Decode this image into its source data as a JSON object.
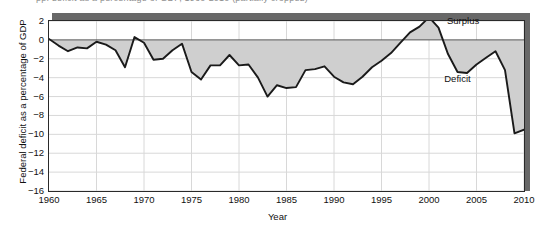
{
  "figure": {
    "cropped_title": "pp. deficit as a percentage of GDP, 1960-2010 (partially cropped)"
  },
  "axes": {
    "ylabel": "Federal deficit as a percentage of GDP",
    "xlabel": "Year",
    "yticks": [
      "2",
      "0",
      "-2",
      "-4",
      "-6",
      "-8",
      "-10",
      "-12",
      "-14",
      "-16"
    ],
    "xticks": [
      "1960",
      "1965",
      "1970",
      "1975",
      "1980",
      "1985",
      "1990",
      "1995",
      "2000",
      "2005",
      "2010"
    ]
  },
  "annotations": {
    "surplus": "Surplus",
    "deficit": "Deficit"
  },
  "colors": {
    "line": "#1a1a1a",
    "fill": "#cfcfcf",
    "frame": "#2a2a2a",
    "shadow": "#686868",
    "grid": "#d8d8d8",
    "zero_line": "#555555"
  },
  "chart_data": {
    "type": "area",
    "xlabel": "Year",
    "ylabel": "Federal deficit as a percentage of GDP",
    "xlim": [
      1960,
      2010
    ],
    "ylim": [
      -16,
      2
    ],
    "ytick_step": 2,
    "xtick_step": 5,
    "grid": true,
    "legend": "none",
    "baseline": 0,
    "annotations": [
      {
        "text": "Surplus",
        "x": 2000,
        "y": 1.4,
        "note": "leader line points to the 2000 peak above zero"
      },
      {
        "text": "Deficit",
        "x": 2003.5,
        "y": -4.0,
        "note": "labels the shaded area below zero"
      }
    ],
    "series": [
      {
        "name": "Federal surplus/deficit as % of GDP",
        "x": [
          1960,
          1961,
          1962,
          1963,
          1964,
          1965,
          1966,
          1967,
          1968,
          1969,
          1970,
          1971,
          1972,
          1973,
          1974,
          1975,
          1976,
          1977,
          1978,
          1979,
          1980,
          1981,
          1982,
          1983,
          1984,
          1985,
          1986,
          1987,
          1988,
          1989,
          1990,
          1991,
          1992,
          1993,
          1994,
          1995,
          1996,
          1997,
          1998,
          1999,
          2000,
          2001,
          2002,
          2003,
          2004,
          2005,
          2006,
          2007,
          2008,
          2009,
          2010
        ],
        "values": [
          0.1,
          -0.6,
          -1.2,
          -0.8,
          -0.9,
          -0.2,
          -0.5,
          -1.1,
          -2.9,
          0.3,
          -0.3,
          -2.1,
          -2.0,
          -1.1,
          -0.4,
          -3.4,
          -4.2,
          -2.7,
          -2.7,
          -1.6,
          -2.7,
          -2.6,
          -4.0,
          -6.0,
          -4.8,
          -5.1,
          -5.0,
          -3.2,
          -3.1,
          -2.8,
          -3.9,
          -4.5,
          -4.7,
          -3.9,
          -2.9,
          -2.2,
          -1.4,
          -0.3,
          0.8,
          1.4,
          2.4,
          1.3,
          -1.5,
          -3.4,
          -3.5,
          -2.6,
          -1.9,
          -1.2,
          -3.2,
          -9.9,
          -9.5
        ]
      }
    ]
  }
}
